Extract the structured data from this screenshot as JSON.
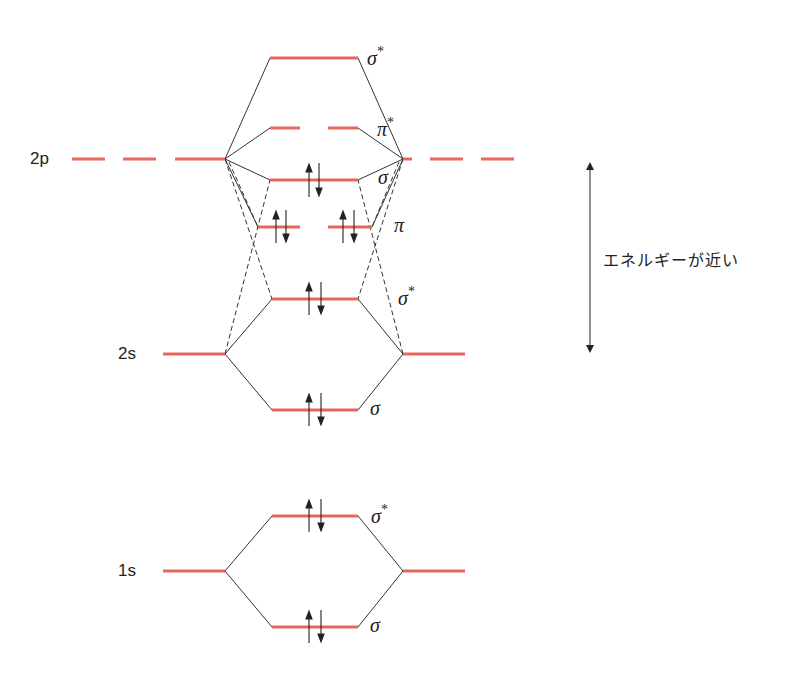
{
  "diagram": {
    "colors": {
      "orbital_level": "#e8675c",
      "connector": "#333333",
      "text": "#222222"
    },
    "atomic_labels": {
      "2p": "2p",
      "2s": "2s",
      "1s": "1s"
    },
    "mo_labels": {
      "sigma_star_2p": "σ",
      "sigma_star_2p_sup": "*",
      "pi_star_2p": "π",
      "pi_star_2p_sup": "*",
      "sigma_2p": "σ",
      "pi_2p": "π",
      "sigma_star_2s": "σ",
      "sigma_star_2s_sup": "*",
      "sigma_2s": "σ",
      "sigma_star_1s": "σ",
      "sigma_star_1s_sup": "*",
      "sigma_1s": "σ"
    },
    "annotation": {
      "text": "エネルギーが近い",
      "meaning": "energies are close"
    },
    "levels": [
      {
        "name": "σ*2p",
        "electrons": 0
      },
      {
        "name": "π*2p",
        "electrons": 0,
        "degenerate": 2
      },
      {
        "name": "σ2p",
        "electrons": 2
      },
      {
        "name": "π2p",
        "electrons": 4,
        "degenerate": 2
      },
      {
        "name": "σ*2s",
        "electrons": 2
      },
      {
        "name": "σ2s",
        "electrons": 2
      },
      {
        "name": "σ*1s",
        "electrons": 2
      },
      {
        "name": "σ1s",
        "electrons": 2
      }
    ]
  }
}
